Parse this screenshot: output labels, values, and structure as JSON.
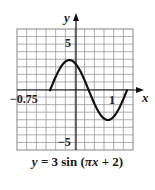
{
  "chart_data": {
    "type": "line",
    "title": "y = 3 sin (πx + 2)",
    "xlabel": "x",
    "ylabel": "y",
    "function": "y = 3 sin(pi*x + 2)",
    "x_tick_labels": [
      "-0.75",
      "1"
    ],
    "y_tick_labels": [
      "5",
      "-5"
    ],
    "xlim": [
      -0.75,
      1.25
    ],
    "ylim": [
      -3,
      3
    ],
    "grid": true,
    "series": [
      {
        "name": "y = 3 sin (πx + 2)",
        "x": [
          -0.64,
          -0.5,
          -0.32,
          -0.14,
          0.0,
          0.2,
          0.36,
          0.5,
          0.68,
          0.86,
          1.0,
          1.2,
          1.36
        ],
        "values": [
          0.0,
          1.26,
          2.72,
          3.0,
          2.73,
          1.4,
          0.0,
          -1.25,
          -2.68,
          -3.0,
          -2.73,
          -1.4,
          0.0
        ]
      }
    ],
    "annotations": {
      "x_left_label": "-0.75",
      "x_right_label": "1",
      "y_top_label": "5",
      "y_bottom_label": "-5"
    }
  },
  "caption": {
    "lhs": "y",
    "equals": " = 3 sin (",
    "pi_x": "πx",
    "rest": " + 2)"
  },
  "labels": {
    "x_axis": "x",
    "y_axis": "y",
    "tick_left": "−0.75",
    "tick_right": "1",
    "tick_top": "5",
    "tick_bottom": "−5"
  }
}
